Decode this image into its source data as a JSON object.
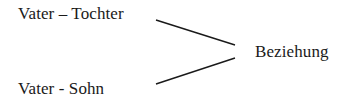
{
  "diagram": {
    "nodes": [
      {
        "id": "vater-tochter",
        "label": "Vater – Tochter"
      },
      {
        "id": "vater-sohn",
        "label": "Vater - Sohn"
      },
      {
        "id": "beziehung",
        "label": "Beziehung"
      }
    ],
    "edges": [
      {
        "from": "vater-tochter",
        "to": "beziehung"
      },
      {
        "from": "vater-sohn",
        "to": "beziehung"
      }
    ],
    "colors": {
      "text": "#1a1a1a",
      "line": "#1a1a1a",
      "background": "#ffffff"
    }
  }
}
